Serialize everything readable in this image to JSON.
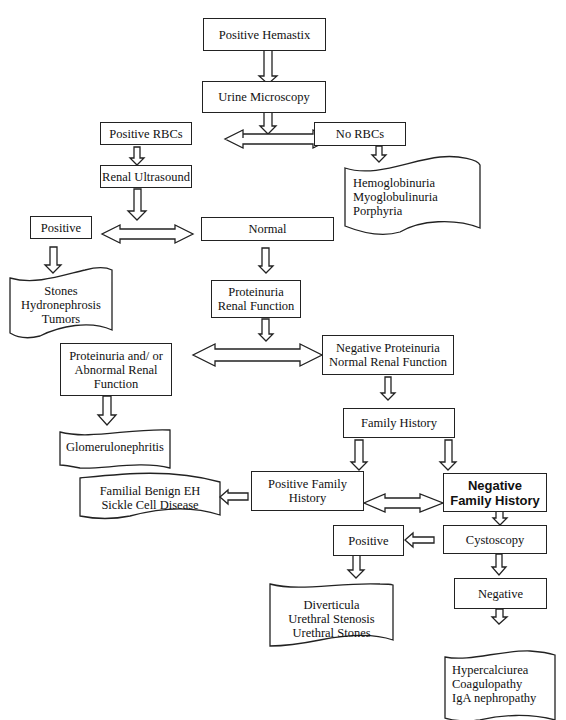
{
  "diagram": {
    "nodes": {
      "positive_hemastix": "Positive Hemastix",
      "urine_microscopy": "Urine Microscopy",
      "positive_rbcs": "Positive RBCs",
      "no_rbcs": "No RBCs",
      "renal_ultrasound": "Renal Ultrasound",
      "us_positive": "Positive",
      "us_normal": "Normal",
      "proteinuria_renal_function": "Proteinuria\nRenal Function",
      "abnormal": "Proteinuria and/ or\nAbnormal Renal\nFunction",
      "negative_proteinuria": "Negative Proteinuria\nNormal Renal Function",
      "family_history": "Family History",
      "positive_family_history": "Positive Family\nHistory",
      "negative_family_history": "Negative\nFamily History",
      "cystoscopy": "Cystoscopy",
      "cysto_positive": "Positive",
      "cysto_negative": "Negative"
    },
    "documents": {
      "no_rbc_causes": "Hemoglobinuria\nMyoglobulinuria\nPorphyria",
      "us_positive_causes": "Stones\nHydronephrosis\nTumors",
      "glomerulonephritis": "Glomerulonephritis",
      "family_causes": "Familial Benign EH\nSickle Cell Disease",
      "cysto_positive_causes": "Diverticula\nUrethral Stenosis\nUrethral Stones",
      "cysto_negative_causes": "Hypercalciurea\nCoagulopathy\nIgA nephropathy"
    },
    "edges": [
      {
        "from": "Positive Hemastix",
        "to": "Urine Microscopy",
        "type": "arrow"
      },
      {
        "from": "Urine Microscopy",
        "to": "Positive RBCs / No RBCs",
        "type": "double-arrow"
      },
      {
        "from": "No RBCs",
        "to": "Hemoglobinuria / Myoglobulinuria / Porphyria",
        "type": "arrow"
      },
      {
        "from": "Positive RBCs",
        "to": "Renal Ultrasound",
        "type": "arrow"
      },
      {
        "from": "Renal Ultrasound",
        "to": "Positive / Normal",
        "type": "double-arrow"
      },
      {
        "from": "Positive",
        "to": "Stones / Hydronephrosis / Tumors",
        "type": "arrow"
      },
      {
        "from": "Normal",
        "to": "Proteinuria Renal Function",
        "type": "arrow"
      },
      {
        "from": "Proteinuria Renal Function",
        "to": "Proteinuria and/or Abnormal Renal Function / Negative Proteinuria Normal Renal Function",
        "type": "double-arrow"
      },
      {
        "from": "Proteinuria and/or Abnormal Renal Function",
        "to": "Glomerulonephritis",
        "type": "arrow"
      },
      {
        "from": "Negative Proteinuria Normal Renal Function",
        "to": "Family History",
        "type": "arrow"
      },
      {
        "from": "Family History",
        "to": "Positive Family History",
        "type": "arrow"
      },
      {
        "from": "Family History",
        "to": "Negative Family History",
        "type": "arrow"
      },
      {
        "from": "Positive Family History",
        "to": "Negative Family History",
        "type": "double-arrow"
      },
      {
        "from": "Positive Family History",
        "to": "Familial Benign EH / Sickle Cell Disease",
        "type": "arrow"
      },
      {
        "from": "Negative Family History",
        "to": "Cystoscopy",
        "type": "arrow"
      },
      {
        "from": "Cystoscopy",
        "to": "Positive",
        "type": "arrow"
      },
      {
        "from": "Cystoscopy",
        "to": "Negative",
        "type": "arrow"
      },
      {
        "from": "Positive",
        "to": "Diverticula / Urethral Stenosis / Urethral Stones",
        "type": "arrow"
      },
      {
        "from": "Negative",
        "to": "Hypercalciurea / Coagulopathy / IgA nephropathy",
        "type": "arrow"
      }
    ]
  }
}
